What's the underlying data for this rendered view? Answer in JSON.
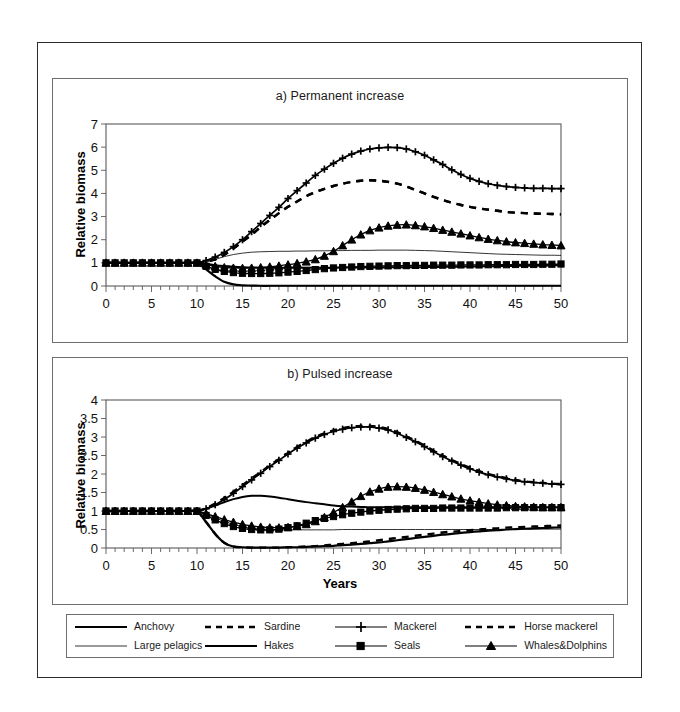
{
  "figure": {
    "panels": [
      {
        "id": "a",
        "title": "a) Permanent increase"
      },
      {
        "id": "b",
        "title": "b) Pulsed increase"
      }
    ],
    "ylabel": "Relative biomass",
    "xlabel": "Years"
  },
  "legend": {
    "items": [
      {
        "label": "Anchovy",
        "style": "solid-thick",
        "marker": "none",
        "key": "anchovy"
      },
      {
        "label": "Sardine",
        "style": "dashed",
        "marker": "none",
        "key": "sardine"
      },
      {
        "label": "Mackerel",
        "style": "solid-thin",
        "marker": "plus",
        "key": "mackerel"
      },
      {
        "label": "Horse mackerel",
        "style": "dashed",
        "marker": "none",
        "key": "horse_mackerel"
      },
      {
        "label": "Large pelagics",
        "style": "solid-hair",
        "marker": "none",
        "key": "large_pelagics"
      },
      {
        "label": "Hakes",
        "style": "solid-thick",
        "marker": "none",
        "key": "hakes"
      },
      {
        "label": "Seals",
        "style": "solid-thin",
        "marker": "square",
        "key": "seals"
      },
      {
        "label": "Whales&Dolphins",
        "style": "solid-thin",
        "marker": "triangle",
        "key": "whales_dolphins"
      }
    ]
  },
  "chart_data": [
    {
      "type": "line",
      "id": "a",
      "title": "a) Permanent increase",
      "xlabel": "",
      "ylabel": "Relative biomass",
      "xlim": [
        0,
        50
      ],
      "ylim": [
        0,
        7
      ],
      "xticks": [
        0,
        5,
        10,
        15,
        20,
        25,
        30,
        35,
        40,
        45,
        50
      ],
      "yticks": [
        0,
        1,
        2,
        3,
        4,
        5,
        6,
        7
      ],
      "xtick_minor_step": 1,
      "grid": false,
      "legend_position": "below-figure",
      "x": [
        0,
        1,
        2,
        3,
        4,
        5,
        6,
        7,
        8,
        9,
        10,
        11,
        12,
        13,
        14,
        15,
        16,
        17,
        18,
        19,
        20,
        21,
        22,
        23,
        24,
        25,
        26,
        27,
        28,
        29,
        30,
        31,
        32,
        33,
        34,
        35,
        36,
        37,
        38,
        39,
        40,
        41,
        42,
        43,
        44,
        45,
        46,
        47,
        48,
        49,
        50
      ],
      "series": [
        {
          "name": "Anchovy",
          "values": [
            1,
            1,
            1,
            1,
            1,
            1,
            1,
            1,
            1,
            1,
            1,
            0.72,
            0.42,
            0.18,
            0.07,
            0.03,
            0.02,
            0.01,
            0.01,
            0.01,
            0.01,
            0.01,
            0.01,
            0.01,
            0.01,
            0.01,
            0.01,
            0.01,
            0.01,
            0.01,
            0.01,
            0.01,
            0.01,
            0.01,
            0.01,
            0.01,
            0.01,
            0.01,
            0.01,
            0.01,
            0.01,
            0.01,
            0.01,
            0.01,
            0.01,
            0.01,
            0.01,
            0.01,
            0.01,
            0.01,
            0.01
          ]
        },
        {
          "name": "Sardine",
          "values": [
            1,
            1,
            1,
            1,
            1,
            1,
            1,
            1,
            1,
            1,
            1,
            1.05,
            1.15,
            1.35,
            1.62,
            1.92,
            2.22,
            2.55,
            2.85,
            3.15,
            3.42,
            3.65,
            3.88,
            4.05,
            4.2,
            4.32,
            4.42,
            4.5,
            4.55,
            4.57,
            4.55,
            4.5,
            4.42,
            4.3,
            4.15,
            4,
            3.85,
            3.72,
            3.6,
            3.5,
            3.42,
            3.35,
            3.3,
            3.25,
            3.2,
            3.17,
            3.15,
            3.13,
            3.12,
            3.11,
            3.1
          ]
        },
        {
          "name": "Mackerel",
          "values": [
            1,
            1,
            1,
            1,
            1,
            1,
            1,
            1,
            1,
            1,
            1,
            1.1,
            1.25,
            1.45,
            1.7,
            2.0,
            2.35,
            2.7,
            3.05,
            3.4,
            3.78,
            4.12,
            4.45,
            4.78,
            5.05,
            5.3,
            5.52,
            5.7,
            5.83,
            5.92,
            5.97,
            5.99,
            5.98,
            5.92,
            5.8,
            5.65,
            5.45,
            5.25,
            5.02,
            4.82,
            4.65,
            4.52,
            4.42,
            4.35,
            4.3,
            4.26,
            4.24,
            4.22,
            4.22,
            4.21,
            4.21
          ]
        },
        {
          "name": "Horse mackerel",
          "values": [
            1,
            1,
            1,
            1,
            1,
            1,
            1,
            1,
            1,
            1,
            1,
            1.05,
            1.15,
            1.35,
            1.62,
            1.92,
            2.22,
            2.55,
            2.85,
            3.15,
            3.42,
            3.65,
            3.88,
            4.05,
            4.2,
            4.32,
            4.42,
            4.5,
            4.55,
            4.57,
            4.55,
            4.5,
            4.42,
            4.3,
            4.15,
            4,
            3.85,
            3.72,
            3.6,
            3.5,
            3.42,
            3.35,
            3.3,
            3.25,
            3.2,
            3.17,
            3.15,
            3.13,
            3.12,
            3.11,
            3.1
          ]
        },
        {
          "name": "Large pelagics",
          "values": [
            1,
            1,
            1,
            1,
            1,
            1,
            1,
            1,
            1,
            1,
            1,
            1.05,
            1.15,
            1.27,
            1.36,
            1.42,
            1.46,
            1.48,
            1.49,
            1.5,
            1.5,
            1.51,
            1.51,
            1.52,
            1.52,
            1.53,
            1.53,
            1.54,
            1.54,
            1.54,
            1.55,
            1.55,
            1.55,
            1.55,
            1.54,
            1.53,
            1.52,
            1.5,
            1.48,
            1.46,
            1.44,
            1.42,
            1.4,
            1.38,
            1.37,
            1.36,
            1.35,
            1.34,
            1.33,
            1.33,
            1.32
          ]
        },
        {
          "name": "Hakes",
          "values": [
            1,
            1,
            1,
            1,
            1,
            1,
            1,
            1,
            1,
            1,
            1,
            0.95,
            0.9,
            0.86,
            0.83,
            0.81,
            0.8,
            0.79,
            0.79,
            0.79,
            0.79,
            0.79,
            0.79,
            0.79,
            0.79,
            0.79,
            0.8,
            0.8,
            0.8,
            0.8,
            0.8,
            0.8,
            0.81,
            0.81,
            0.81,
            0.82,
            0.82,
            0.83,
            0.83,
            0.84,
            0.84,
            0.85,
            0.85,
            0.86,
            0.86,
            0.87,
            0.87,
            0.88,
            0.88,
            0.89,
            0.9
          ]
        },
        {
          "name": "Seals",
          "values": [
            1,
            1,
            1,
            1,
            1,
            1,
            1,
            1,
            1,
            1,
            1,
            0.85,
            0.72,
            0.63,
            0.58,
            0.55,
            0.54,
            0.54,
            0.55,
            0.57,
            0.6,
            0.63,
            0.67,
            0.71,
            0.75,
            0.78,
            0.8,
            0.82,
            0.84,
            0.85,
            0.86,
            0.87,
            0.88,
            0.88,
            0.89,
            0.89,
            0.9,
            0.9,
            0.9,
            0.91,
            0.91,
            0.91,
            0.92,
            0.92,
            0.92,
            0.93,
            0.93,
            0.93,
            0.94,
            0.94,
            0.95
          ]
        },
        {
          "name": "Whales&Dolphins",
          "values": [
            1,
            1,
            1,
            1,
            1,
            1,
            1,
            1,
            1,
            1,
            1,
            0.92,
            0.85,
            0.8,
            0.78,
            0.77,
            0.78,
            0.8,
            0.83,
            0.87,
            0.92,
            0.98,
            1.05,
            1.15,
            1.3,
            1.5,
            1.75,
            2.0,
            2.22,
            2.4,
            2.52,
            2.6,
            2.64,
            2.65,
            2.62,
            2.57,
            2.5,
            2.42,
            2.34,
            2.26,
            2.18,
            2.1,
            2.03,
            1.97,
            1.92,
            1.88,
            1.85,
            1.82,
            1.79,
            1.77,
            1.75
          ]
        }
      ]
    },
    {
      "type": "line",
      "id": "b",
      "title": "b) Pulsed increase",
      "xlabel": "Years",
      "ylabel": "Relative biomass",
      "xlim": [
        0,
        50
      ],
      "ylim": [
        0,
        4
      ],
      "xticks": [
        0,
        5,
        10,
        15,
        20,
        25,
        30,
        35,
        40,
        45,
        50
      ],
      "yticks": [
        0,
        0.5,
        1,
        1.5,
        2,
        2.5,
        3,
        3.5,
        4
      ],
      "xtick_minor_step": 1,
      "grid": false,
      "legend_position": "below-figure",
      "x": [
        0,
        1,
        2,
        3,
        4,
        5,
        6,
        7,
        8,
        9,
        10,
        11,
        12,
        13,
        14,
        15,
        16,
        17,
        18,
        19,
        20,
        21,
        22,
        23,
        24,
        25,
        26,
        27,
        28,
        29,
        30,
        31,
        32,
        33,
        34,
        35,
        36,
        37,
        38,
        39,
        40,
        41,
        42,
        43,
        44,
        45,
        46,
        47,
        48,
        49,
        50
      ],
      "series": [
        {
          "name": "Anchovy",
          "values": [
            1,
            1,
            1,
            1,
            1,
            1,
            1,
            1,
            1,
            1,
            1,
            0.7,
            0.38,
            0.14,
            0.04,
            0.02,
            0.01,
            0.01,
            0.01,
            0.01,
            0.02,
            0.02,
            0.03,
            0.04,
            0.05,
            0.06,
            0.08,
            0.09,
            0.11,
            0.13,
            0.15,
            0.18,
            0.21,
            0.24,
            0.27,
            0.3,
            0.33,
            0.36,
            0.38,
            0.41,
            0.43,
            0.45,
            0.47,
            0.48,
            0.5,
            0.51,
            0.52,
            0.53,
            0.54,
            0.55,
            0.56
          ]
        },
        {
          "name": "Sardine",
          "values": [
            1,
            1,
            1,
            1,
            1,
            1,
            1,
            1,
            1,
            1,
            1,
            1.08,
            1.2,
            1.35,
            1.52,
            1.7,
            1.88,
            2.05,
            2.23,
            2.4,
            2.57,
            2.73,
            2.87,
            3.0,
            3.1,
            3.18,
            3.24,
            3.28,
            3.3,
            3.3,
            3.27,
            3.22,
            3.13,
            3.02,
            2.9,
            2.77,
            2.63,
            2.5,
            2.38,
            2.27,
            2.17,
            2.08,
            2.0,
            1.94,
            1.89,
            1.84,
            1.8,
            1.78,
            1.76,
            1.74,
            1.73
          ]
        },
        {
          "name": "Mackerel",
          "values": [
            1,
            1,
            1,
            1,
            1,
            1,
            1,
            1,
            1,
            1,
            1,
            1.06,
            1.17,
            1.31,
            1.48,
            1.66,
            1.84,
            2.02,
            2.2,
            2.37,
            2.54,
            2.7,
            2.84,
            2.97,
            3.07,
            3.15,
            3.21,
            3.25,
            3.27,
            3.27,
            3.24,
            3.19,
            3.1,
            2.99,
            2.87,
            2.74,
            2.6,
            2.47,
            2.35,
            2.24,
            2.14,
            2.05,
            1.98,
            1.92,
            1.87,
            1.82,
            1.79,
            1.77,
            1.75,
            1.73,
            1.72
          ]
        },
        {
          "name": "Horse mackerel",
          "values": [
            1,
            1,
            1,
            1,
            1,
            1,
            1,
            1,
            1,
            1,
            1,
            0.7,
            0.38,
            0.14,
            0.04,
            0.02,
            0.01,
            0.01,
            0.01,
            0.01,
            0.02,
            0.03,
            0.04,
            0.05,
            0.07,
            0.09,
            0.11,
            0.13,
            0.15,
            0.18,
            0.21,
            0.24,
            0.27,
            0.3,
            0.33,
            0.36,
            0.39,
            0.42,
            0.44,
            0.46,
            0.48,
            0.5,
            0.52,
            0.53,
            0.55,
            0.56,
            0.57,
            0.58,
            0.59,
            0.6,
            0.61
          ]
        },
        {
          "name": "Large pelagics",
          "values": [
            1,
            1,
            1,
            1,
            1,
            1,
            1,
            1,
            1,
            1,
            1,
            0.92,
            0.82,
            0.72,
            0.64,
            0.58,
            0.54,
            0.52,
            0.5,
            0.5,
            0.49,
            0.49,
            0.49,
            0.49,
            0.49,
            0.49,
            0.5,
            0.5,
            0.5,
            0.5,
            0.5,
            0.5,
            0.5,
            0.5,
            0.5,
            0.5,
            0.5,
            0.5,
            0.5,
            0.5,
            0.5,
            0.5,
            0.5,
            0.5,
            0.5,
            0.51,
            0.51,
            0.51,
            0.51,
            0.51,
            0.51
          ]
        },
        {
          "name": "Hakes",
          "values": [
            1,
            1,
            1,
            1,
            1,
            1,
            1,
            1,
            1,
            1,
            1,
            1.06,
            1.15,
            1.24,
            1.32,
            1.38,
            1.41,
            1.41,
            1.39,
            1.36,
            1.32,
            1.28,
            1.24,
            1.21,
            1.18,
            1.15,
            1.13,
            1.12,
            1.11,
            1.1,
            1.1,
            1.1,
            1.1,
            1.1,
            1.1,
            1.1,
            1.1,
            1.1,
            1.1,
            1.1,
            1.1,
            1.1,
            1.1,
            1.1,
            1.1,
            1.1,
            1.1,
            1.1,
            1.1,
            1.1,
            1.1
          ]
        },
        {
          "name": "Seals",
          "values": [
            1,
            1,
            1,
            1,
            1,
            1,
            1,
            1,
            1,
            1,
            1,
            0.88,
            0.76,
            0.66,
            0.58,
            0.53,
            0.5,
            0.49,
            0.49,
            0.51,
            0.55,
            0.6,
            0.67,
            0.74,
            0.8,
            0.85,
            0.9,
            0.94,
            0.97,
            1,
            1.02,
            1.04,
            1.05,
            1.06,
            1.07,
            1.07,
            1.07,
            1.08,
            1.08,
            1.08,
            1.08,
            1.08,
            1.08,
            1.08,
            1.09,
            1.09,
            1.09,
            1.09,
            1.09,
            1.09,
            1.09
          ]
        },
        {
          "name": "Whales&Dolphins",
          "values": [
            1,
            1,
            1,
            1,
            1,
            1,
            1,
            1,
            1,
            1,
            1,
            0.93,
            0.85,
            0.77,
            0.7,
            0.64,
            0.6,
            0.57,
            0.55,
            0.55,
            0.56,
            0.59,
            0.64,
            0.72,
            0.83,
            0.96,
            1.1,
            1.25,
            1.4,
            1.52,
            1.6,
            1.65,
            1.66,
            1.65,
            1.62,
            1.57,
            1.51,
            1.45,
            1.39,
            1.33,
            1.28,
            1.24,
            1.2,
            1.17,
            1.15,
            1.13,
            1.12,
            1.11,
            1.1,
            1.1,
            1.1
          ]
        }
      ]
    }
  ]
}
